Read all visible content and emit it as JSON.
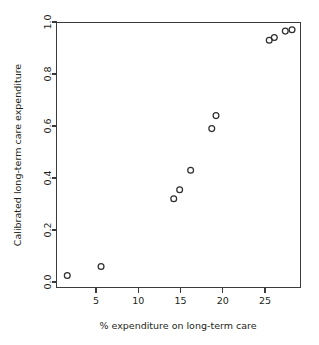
{
  "figure": {
    "caption_remnant": "",
    "background_color": "#ffffff",
    "axis_color": "#3b3a3c",
    "marker_color": "#2f2d2f",
    "text_color": "#231f20"
  },
  "chart_data": {
    "type": "scatter",
    "title": "",
    "xlabel": "% expenditure on long-term care",
    "ylabel": "Calibrated long-term care expenditure",
    "xlim": [
      0.3,
      29.5
    ],
    "ylim": [
      -0.02,
      1.0
    ],
    "grid": false,
    "legend": null,
    "xticks": [
      5,
      10,
      15,
      20,
      25
    ],
    "xtick_labels": [
      "5",
      "10",
      "15",
      "20",
      "25"
    ],
    "yticks": [
      0.0,
      0.2,
      0.4,
      0.6,
      0.8,
      1.0
    ],
    "ytick_labels": [
      "0.0",
      "0.2",
      "0.4",
      "0.6",
      "0.8",
      "1.0"
    ],
    "marker": "open-circle",
    "n_points": 11,
    "x": [
      1.6,
      5.6,
      14.2,
      14.9,
      16.2,
      18.7,
      19.2,
      25.5,
      26.1,
      27.4,
      28.2
    ],
    "y": [
      0.025,
      0.06,
      0.32,
      0.355,
      0.43,
      0.59,
      0.64,
      0.93,
      0.94,
      0.965,
      0.97
    ],
    "points": [
      {
        "x": 1.6,
        "y": 0.025
      },
      {
        "x": 5.6,
        "y": 0.06
      },
      {
        "x": 14.2,
        "y": 0.32
      },
      {
        "x": 14.9,
        "y": 0.355
      },
      {
        "x": 16.2,
        "y": 0.43
      },
      {
        "x": 18.7,
        "y": 0.59
      },
      {
        "x": 19.2,
        "y": 0.64
      },
      {
        "x": 25.5,
        "y": 0.93
      },
      {
        "x": 26.1,
        "y": 0.94
      },
      {
        "x": 27.4,
        "y": 0.965
      },
      {
        "x": 28.2,
        "y": 0.97
      }
    ]
  }
}
